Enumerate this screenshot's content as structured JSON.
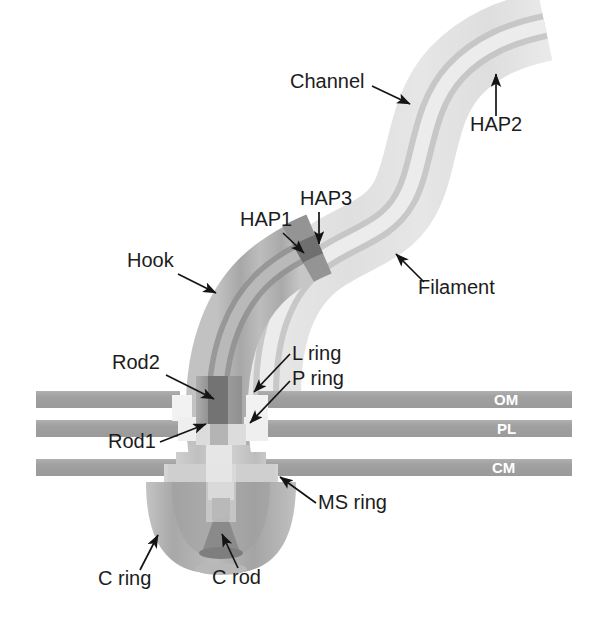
{
  "figure": {
    "background_color": "#ffffff"
  },
  "colors": {
    "membrane": "#a3a3a3",
    "membrane_label_text": "#ffffff",
    "hook": "#b4b4b4",
    "hook_edge": "#9a9a9a",
    "channel_line": "#8f8f8f",
    "filament": "#ededed",
    "filament_edge": "#d8d8d8",
    "hap_junction": "#8d8d8d",
    "rod": "#9b9b9b",
    "rod_dark": "#6e6e6e",
    "ring_light": "#f0f0f0",
    "ms_ring": "#c9c9c9",
    "c_ring": "#b0b0b0",
    "c_rod": "#8a8a8a",
    "label_text": "#1c1c1c",
    "leader_line": "#141414"
  },
  "labels": {
    "channel": "Channel",
    "hap2": "HAP2",
    "hap3": "HAP3",
    "hap1": "HAP1",
    "hook": "Hook",
    "filament": "Filament",
    "rod2": "Rod2",
    "rod1": "Rod1",
    "l_ring": "L ring",
    "p_ring": "P ring",
    "ms_ring": "MS ring",
    "c_ring": "C ring",
    "c_rod": "C rod"
  },
  "membranes": [
    {
      "id": "om",
      "label": "OM",
      "label_x": 494,
      "label_y": 405,
      "y": 391,
      "height": 17
    },
    {
      "id": "pl",
      "label": "PL",
      "label_x": 497,
      "label_y": 434,
      "y": 420,
      "height": 17
    },
    {
      "id": "cm",
      "label": "CM",
      "label_x": 492,
      "label_y": 473,
      "y": 459,
      "height": 17
    }
  ],
  "label_positions": {
    "channel": {
      "x": 290,
      "y": 88
    },
    "hap2": {
      "x": 470,
      "y": 131
    },
    "hap3": {
      "x": 300,
      "y": 205
    },
    "hap1": {
      "x": 240,
      "y": 226
    },
    "hook": {
      "x": 127,
      "y": 267
    },
    "filament": {
      "x": 418,
      "y": 294
    },
    "rod2": {
      "x": 112,
      "y": 369
    },
    "rod1": {
      "x": 108,
      "y": 448
    },
    "l_ring": {
      "x": 292,
      "y": 360
    },
    "p_ring": {
      "x": 292,
      "y": 385
    },
    "ms_ring": {
      "x": 318,
      "y": 509
    },
    "c_ring": {
      "x": 98,
      "y": 585
    },
    "c_rod": {
      "x": 212,
      "y": 584
    }
  }
}
